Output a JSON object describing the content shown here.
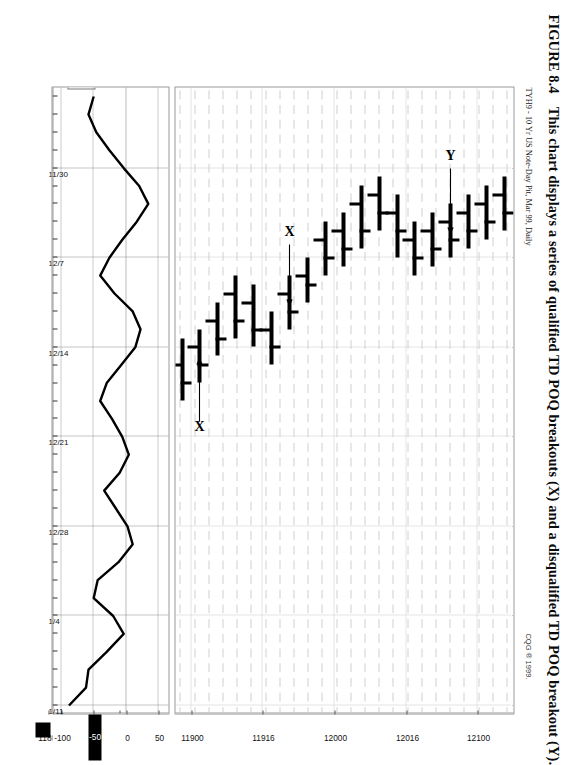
{
  "figure": {
    "number": "FIGURE 8.4",
    "caption": "This chart displays a series of qualified TD POQ breakouts (X) and a disqualified TD POQ breakout (Y)."
  },
  "chart_header": {
    "instrument": "TYH9 - 10 Yr US Note-Day Pit, Mar 99, Daily",
    "copyright": "CQG ® 1999."
  },
  "price_scale": {
    "labels": [
      "12100",
      "12016",
      "12000",
      "11916",
      "11900",
      "11816",
      "11800",
      "11716",
      "11700"
    ],
    "values": [
      12100,
      12016,
      12000,
      11916,
      11900,
      11816,
      11800,
      11716,
      11700
    ]
  },
  "indicator_scale": {
    "name": "TDREI",
    "labels": [
      "50",
      "0",
      "-50",
      "-100"
    ],
    "values": [
      50,
      0,
      -50,
      -100
    ]
  },
  "date_axis": {
    "labels": [
      "1/11",
      "1/4",
      "12/28",
      "12/21",
      "12/14",
      "12/7",
      "11/30"
    ]
  },
  "annotations": [
    {
      "label": "Y",
      "name": "annotation-y-disqualified-breakout"
    },
    {
      "label": "X",
      "name": "annotation-x-breakout-1"
    },
    {
      "label": "X",
      "name": "annotation-x-breakout-2"
    },
    {
      "label": "X",
      "name": "annotation-x-breakout-3"
    },
    {
      "label": "X",
      "name": "annotation-x-breakout-4"
    }
  ],
  "colors": {
    "ink": "#000000",
    "frame": "#9a9a9a",
    "grid": "#c9c9c9",
    "paper": "#ffffff"
  },
  "chart_data": {
    "type": "bar",
    "title": "TYH9 - 10 Yr US Note-Day Pit, Mar 99, Daily",
    "subtitle": "CQG ® 1999.",
    "xlabel": "",
    "ylabel": "Price (32nds)",
    "ylim": [
      11690,
      12110
    ],
    "grid": true,
    "legend": "none",
    "orientation": "rotated-90",
    "x_tick_labels": [
      "11/30",
      "12/7",
      "12/14",
      "12/21",
      "12/28",
      "1/4",
      "1/11"
    ],
    "y_tick_labels": [
      "11700",
      "11716",
      "11800",
      "11816",
      "11900",
      "11916",
      "12000",
      "12016",
      "12100"
    ],
    "categories": [
      "11/30",
      "12/1",
      "12/2",
      "12/3",
      "12/4",
      "12/7",
      "12/8",
      "12/9",
      "12/10",
      "12/11",
      "12/14",
      "12/15",
      "12/16",
      "12/17",
      "12/18",
      "12/21",
      "12/22",
      "12/23",
      "12/24",
      "12/28",
      "12/29",
      "12/30",
      "12/31",
      "1/4",
      "1/5",
      "1/6",
      "1/7",
      "1/8",
      "1/11",
      "1/12",
      "1/13",
      "1/14",
      "1/15",
      "1/19",
      "1/20"
    ],
    "series": [
      {
        "name": "high",
        "values": [
          11812,
          11806,
          11800,
          11724,
          11718,
          11806,
          11812,
          11820,
          11818,
          11810,
          11800,
          11810,
          11822,
          11830,
          11902,
          11910,
          11916,
          11918,
          11924,
          11930,
          11928,
          11922,
          11930,
          12002,
          12010,
          12012,
          12018,
          12020,
          12016,
          12010,
          12012,
          12014,
          12016,
          12018,
          12020
        ]
      },
      {
        "name": "low",
        "values": [
          11726,
          11722,
          11716,
          11710,
          11704,
          11722,
          11728,
          11802,
          11806,
          11800,
          11718,
          11726,
          11808,
          11818,
          11824,
          11826,
          11902,
          11906,
          11912,
          11916,
          11914,
          11910,
          11918,
          11924,
          11930,
          12000,
          12004,
          12008,
          12002,
          11930,
          12000,
          12002,
          12004,
          12006,
          12008
        ]
      },
      {
        "name": "open",
        "values": [
          11730,
          11728,
          11722,
          11714,
          11708,
          11726,
          11800,
          11808,
          11812,
          11804,
          11722,
          11730,
          11812,
          11822,
          11828,
          11830,
          11906,
          11910,
          11916,
          11920,
          11918,
          11914,
          11922,
          11928,
          12002,
          12004,
          12008,
          12012,
          12008,
          12002,
          12004,
          12006,
          12008,
          12010,
          12012
        ]
      },
      {
        "name": "close",
        "values": [
          11806,
          11800,
          11726,
          11718,
          11714,
          11800,
          11808,
          11816,
          11814,
          11806,
          11728,
          11804,
          11818,
          11826,
          11830,
          11906,
          11910,
          11914,
          11920,
          11926,
          11924,
          11918,
          11926,
          11930,
          12006,
          12008,
          12014,
          12016,
          12012,
          12006,
          12008,
          12010,
          12012,
          12014,
          12016
        ]
      }
    ],
    "indicator": {
      "name": "TDREI",
      "type": "line",
      "ylim": [
        -115,
        65
      ],
      "reference_levels": [
        50,
        0,
        -50,
        -100
      ],
      "values": [
        -88,
        -62,
        -58,
        -30,
        -4,
        -20,
        -50,
        -44,
        -12,
        10,
        2,
        -16,
        -34,
        -10,
        4,
        -6,
        -22,
        -40,
        -30,
        -8,
        14,
        22,
        10,
        -18,
        -40,
        -26,
        -6,
        16,
        34,
        20,
        -4,
        -26,
        -46,
        -58,
        -50
      ]
    }
  }
}
